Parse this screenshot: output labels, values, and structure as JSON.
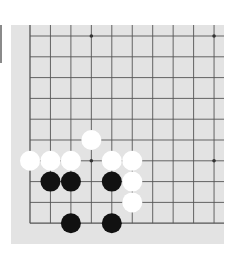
{
  "board": {
    "background": "#e3e3e3",
    "line_color": "#555555",
    "columns": 10,
    "rows": 10,
    "edges": [
      "left",
      "bottom"
    ],
    "star_points": [
      [
        3,
        0
      ],
      [
        9,
        0
      ],
      [
        3,
        6
      ],
      [
        9,
        6
      ]
    ],
    "stones": {
      "white": [
        [
          3,
          5
        ],
        [
          0,
          6
        ],
        [
          1,
          6
        ],
        [
          2,
          6
        ],
        [
          4,
          6
        ],
        [
          5,
          6
        ],
        [
          5,
          7
        ],
        [
          5,
          8
        ]
      ],
      "black": [
        [
          1,
          7
        ],
        [
          2,
          7
        ],
        [
          4,
          7
        ],
        [
          2,
          9
        ],
        [
          4,
          9
        ]
      ]
    },
    "colors": {
      "white": "#ffffff",
      "black": "#111111"
    }
  }
}
